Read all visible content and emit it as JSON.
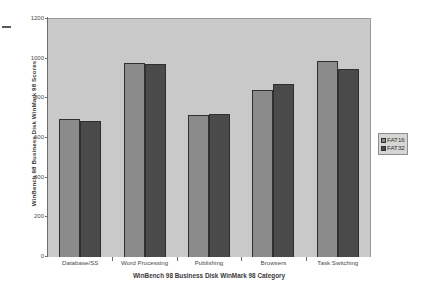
{
  "chart_data": {
    "type": "bar",
    "title": "",
    "xlabel": "WinBench 98 Business Disk WinMark 98 Category",
    "ylabel": "WinBench 98 Business Disk WinMark 98 Scores",
    "categories": [
      "Database/SS",
      "Word Processing",
      "Publishing",
      "Browsers",
      "Task Switching"
    ],
    "series": [
      {
        "name": "FAT16",
        "color": "#8b8b8b",
        "values": [
          695,
          978,
          715,
          840,
          990
        ]
      },
      {
        "name": "FAT32",
        "color": "#4a4a4a",
        "values": [
          688,
          972,
          720,
          872,
          950
        ]
      }
    ],
    "ylim": [
      0,
      1200
    ],
    "ytick_labels": [
      "1200",
      "1000",
      "800",
      "600",
      "400",
      "200",
      "0"
    ],
    "ytick_values": [
      1200,
      1000,
      800,
      600,
      400,
      200,
      0
    ],
    "grid": false,
    "legend_position": "right",
    "plot_background": "#c9c9c9",
    "page_background": "#ffffff"
  }
}
